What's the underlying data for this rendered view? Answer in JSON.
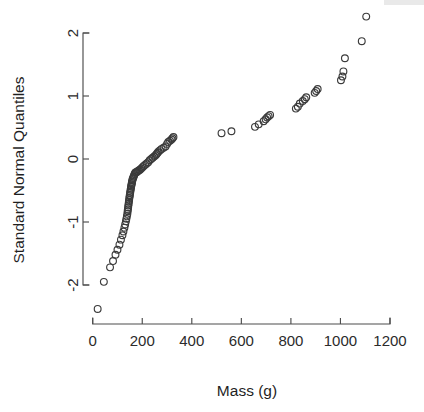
{
  "figure": {
    "name": "normal-quantile-quantile-plot",
    "background_color": "#ffffff",
    "point_color": "#3b3b3b",
    "axis_color": "#4d4d4d",
    "text_color": "#1f1f1f"
  },
  "chart_data": {
    "type": "scatter",
    "title": "",
    "xlabel": "Mass (g)",
    "ylabel": "Standard Normal Quantiles",
    "xlim": [
      0,
      1200
    ],
    "ylim": [
      -2.45,
      2.3
    ],
    "xticks": [
      0,
      200,
      400,
      600,
      800,
      1000,
      1200
    ],
    "xticklabels": [
      "0",
      "200",
      "400",
      "600",
      "800",
      "1000",
      "1200"
    ],
    "yticks": [
      -2,
      -1,
      0,
      1,
      2
    ],
    "yticklabels": [
      "-2",
      "-1",
      "0",
      "1",
      "2"
    ],
    "grid": false,
    "legend": null,
    "marker": "open-circle",
    "marker_radius_px": 3.4,
    "n_points": 96,
    "x": [
      20,
      45,
      70,
      82,
      92,
      100,
      108,
      114,
      120,
      124,
      128,
      131,
      134,
      136,
      138,
      140,
      141,
      142,
      143,
      144,
      145,
      146,
      147,
      148,
      149,
      150,
      151,
      152,
      153,
      154,
      155,
      156,
      157,
      158,
      159,
      160,
      161,
      163,
      165,
      167,
      169,
      171,
      174,
      177,
      180,
      183,
      187,
      191,
      196,
      201,
      206,
      212,
      218,
      224,
      230,
      236,
      242,
      248,
      254,
      258,
      262,
      266,
      272,
      278,
      286,
      294,
      300,
      305,
      312,
      318,
      322,
      326,
      520,
      560,
      655,
      670,
      690,
      698,
      704,
      710,
      716,
      820,
      828,
      836,
      848,
      856,
      862,
      896,
      902,
      908,
      1002,
      1008,
      1012,
      1018,
      1086,
      1104
    ],
    "y": [
      -2.38,
      -1.95,
      -1.72,
      -1.62,
      -1.52,
      -1.44,
      -1.36,
      -1.28,
      -1.21,
      -1.15,
      -1.09,
      -1.04,
      -0.99,
      -0.95,
      -0.91,
      -0.87,
      -0.83,
      -0.8,
      -0.77,
      -0.74,
      -0.71,
      -0.68,
      -0.65,
      -0.62,
      -0.59,
      -0.57,
      -0.54,
      -0.52,
      -0.49,
      -0.47,
      -0.44,
      -0.42,
      -0.4,
      -0.38,
      -0.36,
      -0.34,
      -0.32,
      -0.3,
      -0.28,
      -0.26,
      -0.24,
      -0.22,
      -0.21,
      -0.21,
      -0.2,
      -0.19,
      -0.18,
      -0.17,
      -0.15,
      -0.13,
      -0.11,
      -0.09,
      -0.07,
      -0.05,
      -0.02,
      0.0,
      0.02,
      0.04,
      0.06,
      0.08,
      0.1,
      0.12,
      0.14,
      0.16,
      0.18,
      0.2,
      0.24,
      0.27,
      0.29,
      0.31,
      0.33,
      0.35,
      0.41,
      0.44,
      0.51,
      0.55,
      0.6,
      0.63,
      0.66,
      0.68,
      0.7,
      0.8,
      0.83,
      0.88,
      0.92,
      0.95,
      0.98,
      1.05,
      1.08,
      1.11,
      1.25,
      1.31,
      1.39,
      1.6,
      1.87,
      2.26
    ]
  }
}
